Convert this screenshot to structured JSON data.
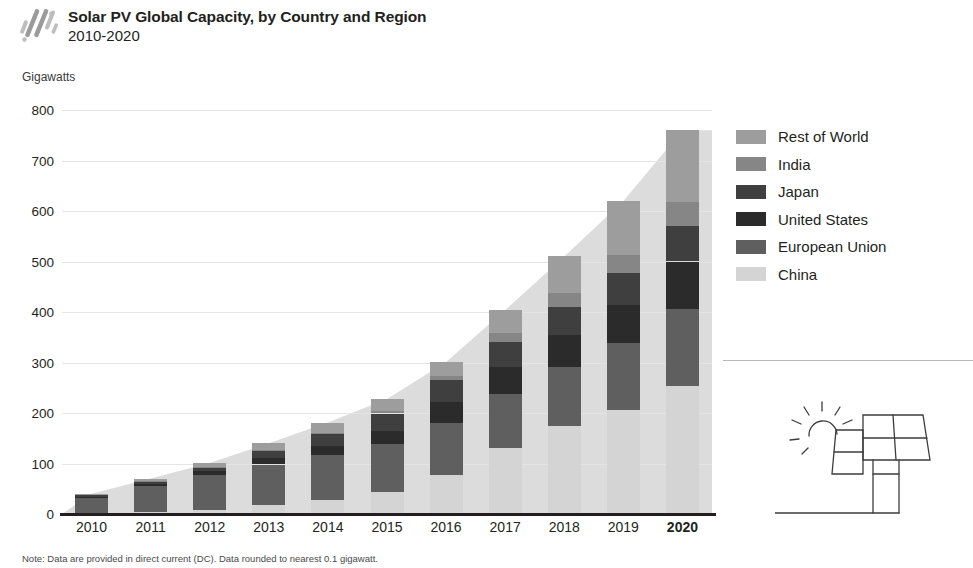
{
  "header": {
    "title": "Solar PV Global Capacity, by Country and Region",
    "subtitle": "2010-2020",
    "logo_icon": "diagonal-stripes-logo"
  },
  "axis_unit_label": "Gigawatts",
  "footnote": "Note: Data are provided in direct current (DC). Data rounded to nearest 0.1 gigawatt.",
  "legend": {
    "items": [
      {
        "label": "Rest of World",
        "color": "#9d9d9d"
      },
      {
        "label": "India",
        "color": "#868686"
      },
      {
        "label": "Japan",
        "color": "#3f3f3f"
      },
      {
        "label": "United States",
        "color": "#2b2b2b"
      },
      {
        "label": "European Union",
        "color": "#5f5f5f"
      },
      {
        "label": "China",
        "color": "#d4d4d4"
      }
    ]
  },
  "illustration": {
    "name": "solar-panel-with-sun",
    "stroke": "#3c3c3c"
  },
  "chart_data": {
    "type": "bar",
    "stacked": true,
    "title": "Solar PV Global Capacity, by Country and Region",
    "subtitle": "2010-2020",
    "xlabel": "",
    "ylabel": "Gigawatts",
    "ylim": [
      0,
      800
    ],
    "yticks": [
      0,
      100,
      200,
      300,
      400,
      500,
      600,
      700,
      800
    ],
    "grid": true,
    "legend_position": "right",
    "emphasized_category": "2020",
    "categories": [
      "2010",
      "2011",
      "2012",
      "2013",
      "2014",
      "2015",
      "2016",
      "2017",
      "2018",
      "2019",
      "2020"
    ],
    "series": [
      {
        "name": "China",
        "color": "#d4d4d4",
        "values": [
          1,
          3,
          7,
          18,
          28,
          44,
          77,
          130,
          175,
          205,
          254
        ]
      },
      {
        "name": "European Union",
        "color": "#5f5f5f",
        "values": [
          30,
          52,
          70,
          80,
          88,
          95,
          104,
          108,
          117,
          133,
          152
        ]
      },
      {
        "name": "United States",
        "color": "#2b2b2b",
        "values": [
          3,
          5,
          8,
          12,
          19,
          26,
          41,
          53,
          62,
          76,
          94
        ]
      },
      {
        "name": "Japan",
        "color": "#3f3f3f",
        "values": [
          4,
          5,
          7,
          14,
          23,
          34,
          43,
          49,
          56,
          63,
          71
        ]
      },
      {
        "name": "India",
        "color": "#868686",
        "values": [
          0,
          1,
          1,
          2,
          3,
          5,
          9,
          18,
          27,
          35,
          47
        ]
      },
      {
        "name": "Rest of World",
        "color": "#9d9d9d",
        "values": [
          2,
          4,
          8,
          14,
          20,
          24,
          27,
          46,
          73,
          108,
          142
        ]
      }
    ],
    "totals": [
      40,
      70,
      101,
      140,
      181,
      228,
      301,
      404,
      510,
      620,
      760
    ]
  }
}
